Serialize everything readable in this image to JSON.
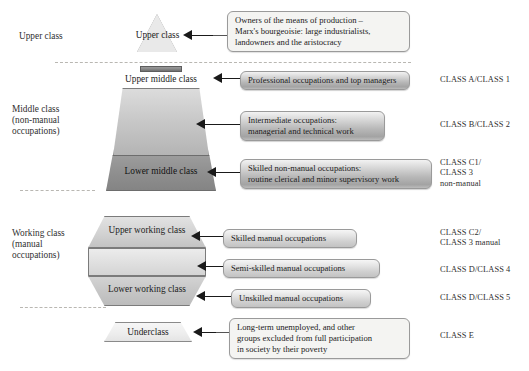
{
  "diagram": {
    "tiers": [
      {
        "left_label": "Upper class",
        "shape_label": "Upper class",
        "callout": "Owners of the means of production –\nMarx's bourgeoisie: large industrialists,\nlandowners and the aristocracy",
        "class_code": ""
      },
      {
        "left_label": "Middle class\n(non-manual\noccupations)",
        "shape_label": "Upper middle class",
        "callout": "Professional occupations and top managers",
        "class_code": "CLASS A/CLASS 1"
      },
      {
        "left_label": "",
        "shape_label": "",
        "callout": "Intermediate occupations:\nmanagerial and technical work",
        "class_code": "CLASS B/CLASS 2"
      },
      {
        "left_label": "",
        "shape_label": "Lower middle class",
        "callout": "Skilled non-manual occupations:\nroutine clerical and minor supervisory work",
        "class_code": "CLASS C1/\nCLASS 3\nnon-manual"
      },
      {
        "left_label": "Working class\n(manual\noccupations)",
        "shape_label": "Upper working class",
        "callout": "Skilled manual occupations",
        "class_code": "CLASS C2/\nCLASS 3 manual"
      },
      {
        "left_label": "",
        "shape_label": "",
        "callout": "Semi-skilled manual occupations",
        "class_code": "CLASS D/CLASS 4"
      },
      {
        "left_label": "",
        "shape_label": "Lower working class",
        "callout": "Unskilled manual occupations",
        "class_code": "CLASS D/CLASS 5"
      },
      {
        "left_label": "",
        "shape_label": "Underclass",
        "callout": "Long-term unemployed, and other\ngroups excluded from full participation\nin society by their poverty",
        "class_code": "CLASS E"
      }
    ],
    "colors": {
      "background": "#ffffff",
      "text": "#2b2b2b",
      "shape_outline": "#7b7b7b",
      "connector": "#1a1a1a",
      "divider": "#b9b7b2"
    }
  }
}
